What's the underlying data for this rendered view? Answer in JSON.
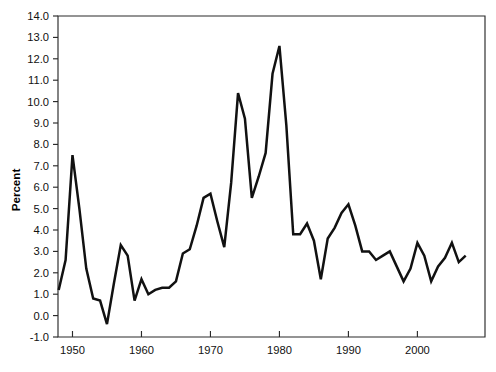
{
  "chart_data": {
    "type": "line",
    "title": "",
    "xlabel": "",
    "ylabel": "Percent",
    "xlim": [
      1948,
      2007
    ],
    "ylim": [
      -1.0,
      14.0
    ],
    "grid": false,
    "legend": "none",
    "xticks": [
      1950,
      1960,
      1970,
      1980,
      1990,
      2000
    ],
    "xtick_labels": [
      "1950",
      "1960",
      "1970",
      "1980",
      "1990",
      "2000"
    ],
    "yticks": [
      -1.0,
      0.0,
      1.0,
      2.0,
      3.0,
      4.0,
      5.0,
      6.0,
      7.0,
      8.0,
      9.0,
      10.0,
      11.0,
      12.0,
      13.0,
      14.0
    ],
    "ytick_labels": [
      "-1.0",
      "0.0",
      "1.0",
      "2.0",
      "3.0",
      "4.0",
      "5.0",
      "6.0",
      "7.0",
      "8.0",
      "9.0",
      "10.0",
      "11.0",
      "12.0",
      "13.0",
      "14.0"
    ],
    "series": [
      {
        "name": "Percent",
        "color": "#111111",
        "x": [
          1948,
          1949,
          1950,
          1951,
          1952,
          1953,
          1954,
          1955,
          1956,
          1957,
          1958,
          1959,
          1960,
          1961,
          1962,
          1963,
          1964,
          1965,
          1966,
          1967,
          1968,
          1969,
          1970,
          1971,
          1972,
          1973,
          1974,
          1975,
          1976,
          1977,
          1978,
          1979,
          1980,
          1981,
          1982,
          1983,
          1984,
          1985,
          1986,
          1987,
          1988,
          1989,
          1990,
          1991,
          1992,
          1993,
          1994,
          1995,
          1996,
          1997,
          1998,
          1999,
          2000,
          2001,
          2002,
          2003,
          2004,
          2005,
          2006,
          2007
        ],
        "y": [
          1.2,
          2.6,
          7.5,
          5.0,
          2.2,
          0.8,
          0.7,
          -0.4,
          1.5,
          3.3,
          2.8,
          0.7,
          1.7,
          1.0,
          1.2,
          1.3,
          1.3,
          1.6,
          2.9,
          3.1,
          4.2,
          5.5,
          5.7,
          4.4,
          3.2,
          6.2,
          10.4,
          9.2,
          5.5,
          6.5,
          7.6,
          11.3,
          12.6,
          8.9,
          3.8,
          3.8,
          4.3,
          3.5,
          1.7,
          3.6,
          4.1,
          4.8,
          5.2,
          4.2,
          3.0,
          3.0,
          2.6,
          2.8,
          3.0,
          2.3,
          1.6,
          2.2,
          3.4,
          2.8,
          1.6,
          2.3,
          2.7,
          3.4,
          2.5,
          2.8
        ]
      }
    ]
  },
  "plot": {
    "left": 58,
    "right": 485,
    "top": 16,
    "bottom": 337,
    "year_left": 1947.9,
    "year_right": 2009.8
  }
}
